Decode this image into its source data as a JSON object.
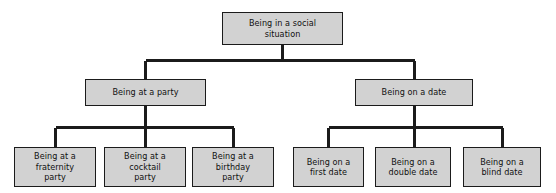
{
  "diagram": {
    "type": "tree",
    "colors": {
      "node_fill": "#d2d2d2",
      "node_border": "#1b1b1b",
      "connector": "#1b1b1b",
      "background": "#ffffff",
      "text": "#101010"
    },
    "levels": [
      {
        "level": 1,
        "nodes": [
          {
            "id": "root",
            "label": "Being in a social\nsituation"
          }
        ]
      },
      {
        "level": 2,
        "nodes": [
          {
            "id": "party",
            "label": "Being at a party"
          },
          {
            "id": "date",
            "label": "Being on a date"
          }
        ]
      },
      {
        "level": 3,
        "nodes": [
          {
            "id": "fraternity",
            "label": "Being at a\nfraternity\nparty"
          },
          {
            "id": "cocktail",
            "label": "Being at a\ncocktail\nparty"
          },
          {
            "id": "birthday",
            "label": "Being at a\nbirthday\nparty"
          },
          {
            "id": "first-date",
            "label": "Being on a\nfirst date"
          },
          {
            "id": "double-date",
            "label": "Being on a\ndouble date"
          },
          {
            "id": "blind-date",
            "label": "Being on a\nblind date"
          }
        ]
      }
    ],
    "edges": [
      {
        "from": "root",
        "to": "party"
      },
      {
        "from": "root",
        "to": "date"
      },
      {
        "from": "party",
        "to": "fraternity"
      },
      {
        "from": "party",
        "to": "cocktail"
      },
      {
        "from": "party",
        "to": "birthday"
      },
      {
        "from": "date",
        "to": "first-date"
      },
      {
        "from": "date",
        "to": "double-date"
      },
      {
        "from": "date",
        "to": "blind-date"
      }
    ]
  }
}
